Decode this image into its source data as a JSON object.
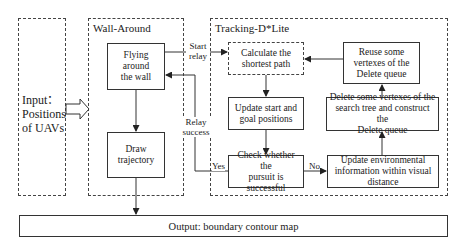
{
  "input": {
    "lines": [
      "Input：",
      "Positions",
      "of UAVs"
    ]
  },
  "wall_around": {
    "title": "Wall-Around",
    "flying": [
      "Flying around",
      "the wall"
    ],
    "draw": [
      "Draw",
      "trajectory"
    ]
  },
  "tracking": {
    "title": "Tracking-D*Lite",
    "calculate": [
      "Calculate the",
      "shortest path"
    ],
    "update_start": [
      "Update start and",
      "goal positions"
    ],
    "check": [
      "Check whether the",
      "pursuit is",
      "successful"
    ],
    "reuse": [
      "Reuse some",
      "vertexes of the",
      "Delete queue"
    ],
    "delete": [
      "Delete some vertexes of the",
      "search tree and construct the",
      "Delete queue"
    ],
    "update_env": [
      "Update environmental",
      "information within visual",
      "distance"
    ]
  },
  "edges": {
    "start_relay": [
      "Start",
      "relay"
    ],
    "relay_success": [
      "Relay",
      "success"
    ],
    "yes": "Yes",
    "no": "No"
  },
  "output": {
    "label": "Output: boundary contour map"
  },
  "colors": {
    "line": "#333333",
    "background": "#ffffff"
  }
}
